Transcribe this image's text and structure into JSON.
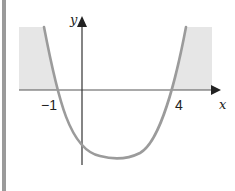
{
  "figure": {
    "type": "parabola-graph",
    "x_axis_label": "x",
    "y_axis_label": "y",
    "x_tick_labels": [
      "-1",
      "4"
    ],
    "x_tick_values": [
      -1,
      4
    ],
    "x_tick_display": [
      "−1",
      "4"
    ],
    "curve": "y = (x + 1)(x - 4)",
    "roots": [
      -1,
      4
    ],
    "shaded_regions": [
      "x < -1 (above x-axis)",
      "x > 4 (above x-axis)"
    ],
    "colors": {
      "curve": "#9b9b9b",
      "shade": "#e6e6e6",
      "axis": "#333333",
      "border": "#9a9a9a"
    }
  }
}
